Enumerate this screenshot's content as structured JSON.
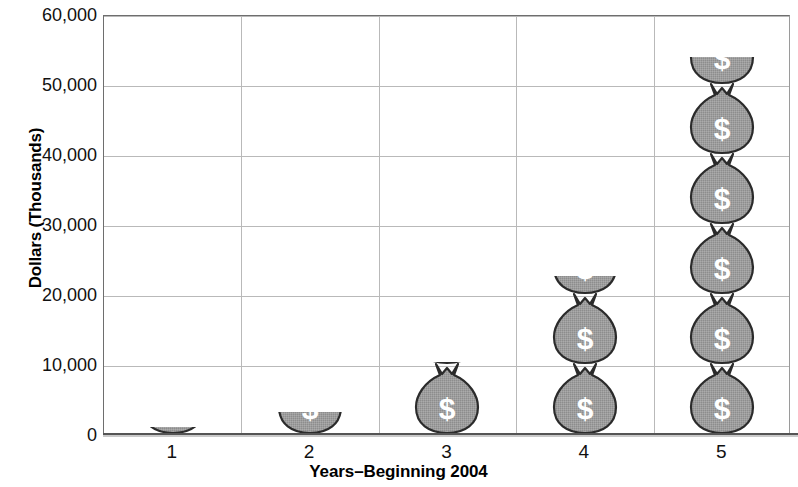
{
  "chart_data": {
    "type": "bar",
    "title": "",
    "xlabel": "Years–Beginning 2004",
    "ylabel": "Dollars (Thousands)",
    "categories": [
      "1",
      "2",
      "3",
      "4",
      "5"
    ],
    "values": [
      1100,
      3300,
      10500,
      22700,
      54000
    ],
    "ylim": [
      0,
      60000
    ],
    "ytick_labels": [
      "60,000",
      "50,000",
      "40,000",
      "30,000",
      "20,000",
      "10,000",
      "0"
    ],
    "ytick_values": [
      60000,
      50000,
      40000,
      30000,
      20000,
      10000,
      0
    ],
    "grid": "horizontal-and-vertical",
    "legend": "none",
    "bar_style": "stacked-money-bag-pictograph",
    "bag_unit_value": 7700,
    "colors": {
      "bag_fill": "#9d9d9d",
      "bag_outline": "#2b2b2b",
      "bag_symbol": "#ffffff",
      "grid": "#b9b9b9",
      "axis": "#6e6e6e",
      "text": "#111111",
      "background": "#ffffff"
    },
    "bag_symbol": "$"
  },
  "icons": {
    "money_bag": "money-bag-icon",
    "dollar_sign": "dollar-sign-icon"
  }
}
